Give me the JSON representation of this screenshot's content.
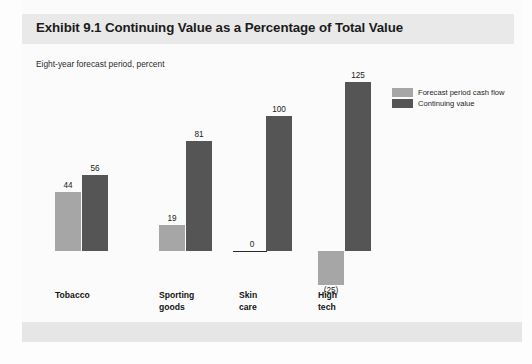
{
  "exhibit": {
    "title": "Exhibit 9.1 Continuing Value as a Percentage of Total Value",
    "subtitle": "Eight-year forecast period, percent"
  },
  "legend": {
    "items": [
      {
        "label": "Forecast period cash flow",
        "color": "#a6a6a6"
      },
      {
        "label": "Continuing value",
        "color": "#555555"
      }
    ]
  },
  "colors": {
    "forecast_bar": "#a6a6a6",
    "continuing_bar": "#555555",
    "title_band": "#e9e9e9",
    "footer_band": "#e6e6e6",
    "axis": "#2a2a2a"
  },
  "chart_data": {
    "type": "bar",
    "title": "Exhibit 9.1 Continuing Value as a Percentage of Total Value",
    "subtitle": "Eight-year forecast period, percent",
    "xlabel": "",
    "ylabel": "percent",
    "categories": [
      "Tobacco",
      "Sporting goods",
      "Skin care",
      "High tech"
    ],
    "category_lines": [
      [
        "Tobacco"
      ],
      [
        "Sporting",
        "goods"
      ],
      [
        "Skin",
        "care"
      ],
      [
        "High",
        "tech"
      ]
    ],
    "series": [
      {
        "name": "Forecast period cash flow",
        "color": "#a6a6a6",
        "values": [
          44,
          19,
          0,
          -25
        ],
        "labels": [
          "44",
          "19",
          "0",
          "(25)"
        ]
      },
      {
        "name": "Continuing value",
        "color": "#555555",
        "values": [
          56,
          81,
          100,
          125
        ],
        "labels": [
          "56",
          "81",
          "100",
          "125"
        ]
      }
    ],
    "ylim": [
      -25,
      125
    ],
    "grid": false,
    "legend_position": "top-right",
    "zero_line": true
  }
}
